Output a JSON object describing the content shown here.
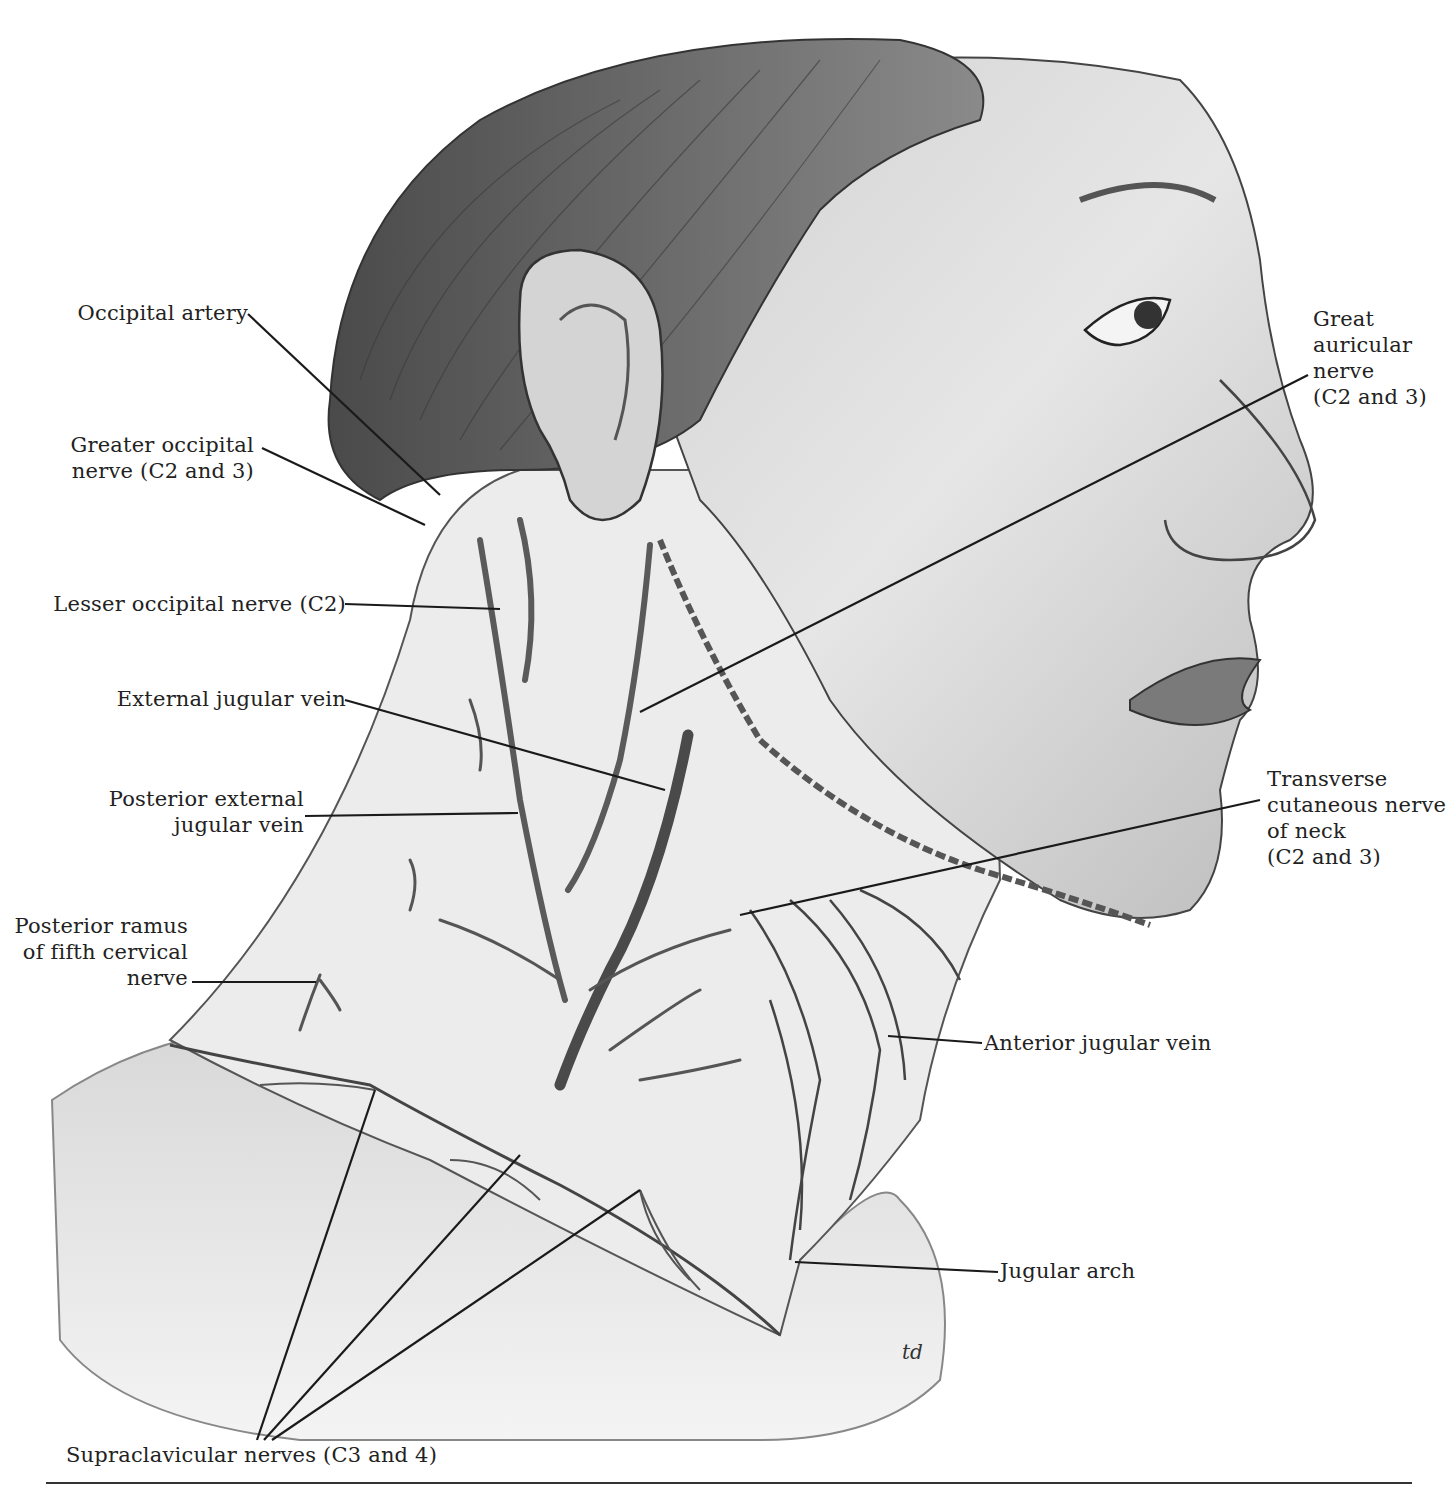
{
  "figure": {
    "artist_initials": "td",
    "colors": {
      "background": "#ffffff",
      "ink": "#1a1a1a",
      "skin_light": "#e9e9e9",
      "skin_mid": "#bdbdbd",
      "hair": "#6e6e6e",
      "vessel": "#555555"
    }
  },
  "labels": {
    "occipital_artery": {
      "lines": [
        "Occipital artery"
      ],
      "target": [
        440,
        495
      ]
    },
    "greater_occipital_nerve": {
      "lines": [
        "Greater occipital",
        "nerve (C2 and 3)"
      ],
      "target": [
        425,
        525
      ]
    },
    "lesser_occipital_nerve": {
      "lines": [
        "Lesser occipital nerve (C2)"
      ],
      "target": [
        500,
        609
      ]
    },
    "external_jugular_vein": {
      "lines": [
        "External jugular vein"
      ],
      "target": [
        665,
        790
      ]
    },
    "posterior_external_jugular_vein": {
      "lines": [
        "Posterior external",
        "jugular vein"
      ],
      "target": [
        518,
        813
      ]
    },
    "posterior_ramus_c5": {
      "lines": [
        "Posterior ramus",
        "of fifth cervical",
        "nerve"
      ],
      "target": [
        316,
        982
      ]
    },
    "great_auricular_nerve": {
      "lines": [
        "Great",
        "auricular",
        "nerve",
        "(C2 and 3)"
      ],
      "target": [
        640,
        712
      ]
    },
    "transverse_cutaneous_nerve": {
      "lines": [
        "Transverse",
        "cutaneous nerve",
        "of neck",
        "(C2 and 3)"
      ],
      "target": [
        740,
        915
      ]
    },
    "anterior_jugular_vein": {
      "lines": [
        "Anterior jugular vein"
      ],
      "target": [
        888,
        1036
      ]
    },
    "jugular_arch": {
      "lines": [
        "Jugular arch"
      ],
      "target": [
        795,
        1262
      ]
    },
    "supraclavicular_nerves": {
      "lines": [
        "Supraclavicular nerves (C3 and 4)"
      ],
      "targets": [
        [
          375,
          1090
        ],
        [
          520,
          1155
        ],
        [
          640,
          1190
        ]
      ]
    }
  }
}
